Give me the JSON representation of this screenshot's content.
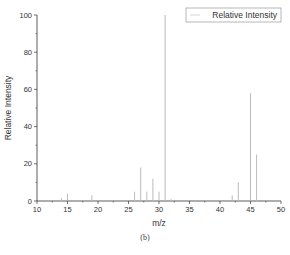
{
  "chart_data": {
    "type": "bar",
    "title": "",
    "xlabel": "m/z",
    "ylabel": "Relative Intensity",
    "xlim": [
      10,
      50
    ],
    "ylim": [
      0,
      100
    ],
    "xticks": [
      10,
      15,
      20,
      25,
      30,
      35,
      40,
      45,
      50
    ],
    "yticks": [
      0,
      20,
      40,
      60,
      80,
      100
    ],
    "grid": false,
    "legend_position": "top-right",
    "series": [
      {
        "name": "Relative Intensity",
        "color": "#bbbbbb",
        "x": [
          14,
          15,
          19,
          26,
          27,
          28,
          29,
          30,
          31,
          32,
          42,
          43,
          45,
          46
        ],
        "values": [
          1.5,
          4,
          3,
          5,
          18,
          5,
          12,
          5,
          100,
          1,
          3,
          10,
          58,
          25
        ]
      }
    ],
    "caption": "(b)"
  },
  "caption": "(b)"
}
